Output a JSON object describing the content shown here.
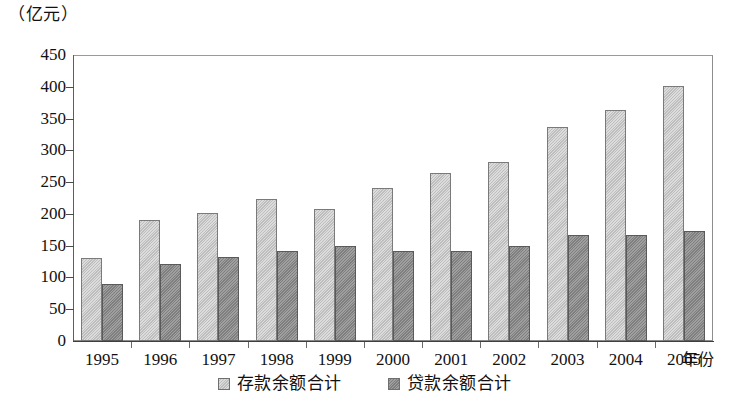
{
  "chart_data": {
    "type": "bar",
    "title": "",
    "subtitle": "",
    "unit_label": "（亿元）",
    "xlabel": "年份",
    "ylabel": "",
    "categories": [
      "1995",
      "1996",
      "1997",
      "1998",
      "1999",
      "2000",
      "2001",
      "2002",
      "2003",
      "2004",
      "2005"
    ],
    "series": [
      {
        "name": "存款余额合计",
        "color": "#c9c9c9",
        "values": [
          130,
          190,
          201,
          223,
          208,
          240,
          265,
          281,
          337,
          363,
          402
        ]
      },
      {
        "name": "贷款余额合计",
        "color": "#8d8d8d",
        "values": [
          90,
          121,
          132,
          142,
          150,
          142,
          142,
          150,
          167,
          167,
          173
        ]
      }
    ],
    "ylim": [
      0,
      450
    ],
    "ytick_step": 50,
    "ytick_labels": [
      "450",
      "400",
      "350",
      "300",
      "250",
      "200",
      "150",
      "100",
      "50",
      "0"
    ],
    "ytick_values": [
      450,
      400,
      350,
      300,
      250,
      200,
      150,
      100,
      50,
      0
    ],
    "grid": false,
    "legend_position": "bottom-center",
    "frame": true
  },
  "legend": {
    "items": [
      {
        "label": "存款余额合计",
        "swatch": "deposit"
      },
      {
        "label": "贷款余额合计",
        "swatch": "loan"
      }
    ]
  }
}
